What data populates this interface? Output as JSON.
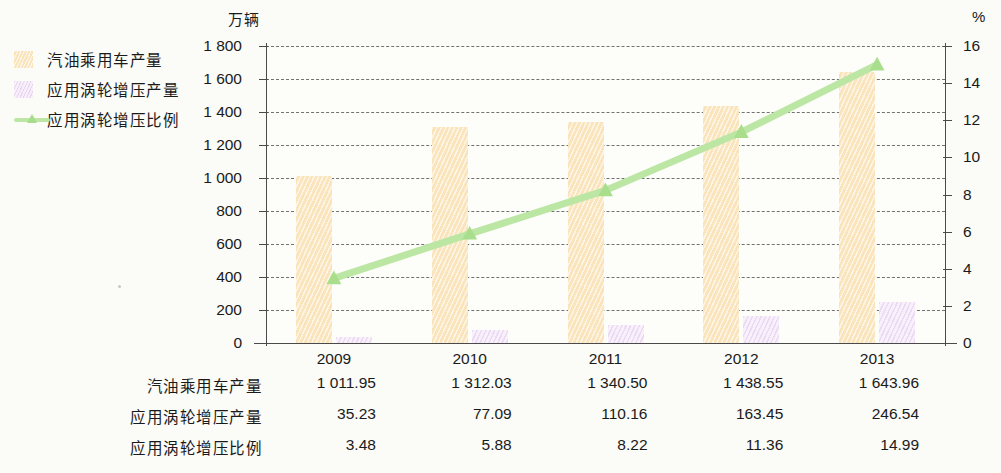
{
  "legend": {
    "items": [
      {
        "label": "汽油乘用车产量",
        "type": "bar",
        "color": "#fae4bc",
        "icon": "square-swatch-icon"
      },
      {
        "label": "应用涡轮增压产量",
        "type": "bar",
        "color": "#f7effa",
        "icon": "square-swatch-icon"
      },
      {
        "label": "应用涡轮增压比例",
        "type": "line",
        "color": "#bce6a4",
        "icon": "line-marker-icon"
      }
    ]
  },
  "axes": {
    "left_unit": "万辆",
    "right_unit": "%",
    "left_ticks": [
      "1 800",
      "1 600",
      "1 400",
      "1 200",
      "1 000",
      "800",
      "600",
      "400",
      "200",
      "0"
    ],
    "right_ticks": [
      "16",
      "14",
      "12",
      "10",
      "8",
      "6",
      "4",
      "2",
      "0"
    ]
  },
  "table": {
    "header": [
      "2009",
      "2010",
      "2011",
      "2012",
      "2013"
    ],
    "rows": [
      {
        "label": "汽油乘用车产量",
        "values": [
          "1 011.95",
          "1 312.03",
          "1 340.50",
          "1 438.55",
          "1 643.96"
        ]
      },
      {
        "label": "应用涡轮增压产量",
        "values": [
          "35.23",
          "77.09",
          "110.16",
          "163.45",
          "246.54"
        ]
      },
      {
        "label": "应用涡轮增压比例",
        "values": [
          "3.48",
          "5.88",
          "8.22",
          "11.36",
          "14.99"
        ]
      }
    ]
  },
  "chart_data": {
    "type": "bar",
    "title": "",
    "xlabel": "",
    "ylabel": "万辆",
    "y2label": "%",
    "categories": [
      "2009",
      "2010",
      "2011",
      "2012",
      "2013"
    ],
    "ylim": [
      0,
      1800
    ],
    "y2lim": [
      0,
      16
    ],
    "ytick_step": 200,
    "y2tick_step": 2,
    "grid": true,
    "legend_position": "left",
    "series": [
      {
        "name": "汽油乘用车产量",
        "type": "bar",
        "axis": "left",
        "color": "#fae4bc",
        "values": [
          1011.95,
          1312.03,
          1340.5,
          1438.55,
          1643.96
        ]
      },
      {
        "name": "应用涡轮增压产量",
        "type": "bar",
        "axis": "left",
        "color": "#f7effa",
        "values": [
          35.23,
          77.09,
          110.16,
          163.45,
          246.54
        ]
      },
      {
        "name": "应用涡轮增压比例",
        "type": "line",
        "axis": "right",
        "color": "#bce6a4",
        "values": [
          3.48,
          5.88,
          8.22,
          11.36,
          14.99
        ]
      }
    ]
  }
}
